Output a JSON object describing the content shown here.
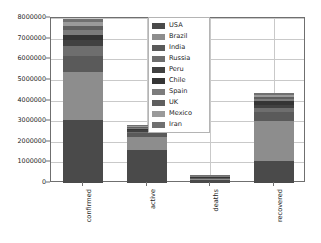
{
  "chart_data": {
    "type": "bar",
    "subtype": "stacked-bar",
    "title": "",
    "xlabel": "",
    "ylabel": "",
    "categories": [
      "confirmed",
      "active",
      "deaths",
      "recovered"
    ],
    "ylim": [
      0,
      8000000
    ],
    "ytick_labels": [
      "0",
      "1000000",
      "2000000",
      "3000000",
      "4000000",
      "5000000",
      "6000000",
      "7000000",
      "8000000"
    ],
    "ytick_values": [
      0,
      1000000,
      2000000,
      3000000,
      4000000,
      5000000,
      6000000,
      7000000,
      8000000
    ],
    "grid": true,
    "legend_position": "upper center",
    "legend_entries": [
      "USA",
      "Brazil",
      "India",
      "Russia",
      "Peru",
      "Chile",
      "Spain",
      "UK",
      "Mexico",
      "Iran"
    ],
    "series": [
      {
        "name": "USA",
        "color": "#4a4a4a",
        "values": [
          3120000,
          1620000,
          133000,
          1370000
        ]
      },
      {
        "name": "Brazil",
        "color": "#8d8d8d",
        "values": [
          2380000,
          600000,
          86000,
          2510000
        ]
      },
      {
        "name": "India",
        "color": "#5a5a5a",
        "values": [
          810000,
          190000,
          22000,
          560000
        ]
      },
      {
        "name": "Russia",
        "color": "#6e6e6e",
        "values": [
          480000,
          70000,
          8000,
          300000
        ]
      },
      {
        "name": "Peru",
        "color": "#414141",
        "values": [
          300000,
          90000,
          11000,
          195000
        ]
      },
      {
        "name": "Chile",
        "color": "#353535",
        "values": [
          280000,
          35000,
          7000,
          240000
        ]
      },
      {
        "name": "Spain",
        "color": "#7c7c7c",
        "values": [
          230000,
          70000,
          28000,
          130000
        ]
      },
      {
        "name": "UK",
        "color": "#5f5f5f",
        "values": [
          200000,
          60000,
          41000,
          95000
        ]
      },
      {
        "name": "Mexico",
        "color": "#9a9a9a",
        "values": [
          185000,
          50000,
          22000,
          120000
        ]
      },
      {
        "name": "Iran",
        "color": "#707070",
        "values": [
          165000,
          45000,
          9000,
          130000
        ]
      }
    ],
    "totals": [
      8150000,
      2830000,
      367000,
      5650000
    ],
    "bar_tops": [
      7950000,
      2830000,
      400000,
      4350000
    ]
  },
  "axes": {
    "frame_color": "#6f6f6f",
    "grid_color": "#c9c9c9",
    "background": "#ffffff"
  }
}
